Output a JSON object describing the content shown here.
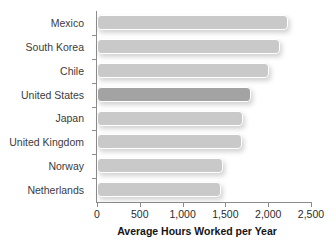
{
  "chart_data": {
    "type": "bar",
    "orientation": "horizontal",
    "title": "",
    "xlabel": "Average Hours Worked per Year",
    "ylabel": "",
    "categories": [
      "Mexico",
      "South Korea",
      "Chile",
      "United States",
      "Japan",
      "United Kingdom",
      "Norway",
      "Netherlands"
    ],
    "values": [
      2230,
      2135,
      2010,
      1800,
      1705,
      1690,
      1470,
      1445
    ],
    "xlim": [
      0,
      2500
    ],
    "xticks": [
      0,
      500,
      1000,
      1500,
      2000,
      2500
    ],
    "xtick_labels": [
      "0",
      "500",
      "1,000",
      "1,500",
      "2,000",
      "2,500"
    ],
    "grid": false,
    "legend": "none",
    "highlight_category": "United States",
    "colors": {
      "bar": "#c9c9c9",
      "bar_highlight": "#a3a3a3",
      "axis": "#8c8c8c",
      "label_text": "#3b3b3b",
      "title_text": "#141414"
    }
  }
}
